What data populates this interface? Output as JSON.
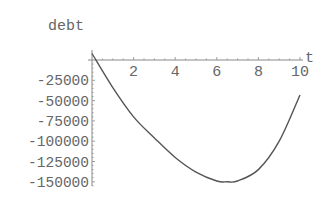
{
  "chart_data": {
    "type": "line",
    "title": "",
    "xlabel": "t",
    "ylabel": "debt",
    "xlim": [
      0,
      10
    ],
    "ylim": [
      -155000,
      10000
    ],
    "grid": false,
    "legend": null,
    "x_ticks": [
      2,
      4,
      6,
      8,
      10
    ],
    "x_tick_labels": [
      "2",
      "4",
      "6",
      "8",
      "10"
    ],
    "y_ticks": [
      -25000,
      -50000,
      -75000,
      -100000,
      -125000,
      -150000
    ],
    "y_tick_labels": [
      "-25000",
      "-50000",
      "-75000",
      "-100000",
      "-125000",
      "-150000"
    ],
    "series": [
      {
        "name": "debt",
        "color": "#555555",
        "x": [
          0,
          1,
          2,
          3,
          4,
          5,
          6,
          6.5,
          7,
          8,
          9,
          10
        ],
        "y": [
          8000,
          -34000,
          -70000,
          -96000,
          -120000,
          -138000,
          -149000,
          -150000,
          -149000,
          -135000,
          -100000,
          -43000
        ]
      }
    ]
  },
  "colors": {
    "axis": "#888888",
    "text": "#666666",
    "curve": "#555555",
    "background": "#ffffff"
  }
}
